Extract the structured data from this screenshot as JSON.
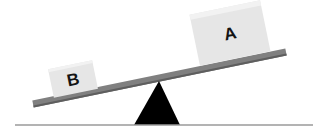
{
  "scene": {
    "name": "lever-balance-diagram",
    "width": 323,
    "height": 135,
    "background_color": "#ffffff"
  },
  "ground": {
    "name": "ground-line",
    "color": "#9a9a9a",
    "x1": 15,
    "y1": 125,
    "x2": 313,
    "y2": 125,
    "thickness": 1.6
  },
  "fulcrum": {
    "name": "fulcrum-triangle",
    "color": "#000000",
    "apex_x": 159,
    "apex_y": 81,
    "base_left_x": 134,
    "base_right_x": 180,
    "base_y": 125
  },
  "lever": {
    "name": "lever-bar",
    "color": "#808080",
    "edge_color": "#5e5e5e",
    "left_x": 33,
    "left_y": 104,
    "right_x": 286,
    "right_y": 52,
    "thickness": 7,
    "tilt_degrees": -11.6
  },
  "blocks": [
    {
      "id": "block-a",
      "label": "A",
      "side": "right",
      "fill_color": "#e6e6e6",
      "highlight_color": "#f2f2f2",
      "label_color": "#141414",
      "center_x": 230,
      "center_y": 33,
      "width": 72,
      "height": 52,
      "rotation_degrees": -11.6
    },
    {
      "id": "block-b",
      "label": "B",
      "side": "left",
      "fill_color": "#e6e6e6",
      "highlight_color": "#f2f2f2",
      "label_color": "#141414",
      "center_x": 73,
      "center_y": 79,
      "width": 45,
      "height": 29,
      "rotation_degrees": -11.6
    }
  ]
}
